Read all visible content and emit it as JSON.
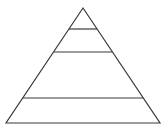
{
  "diagram": {
    "type": "pyramid",
    "levels": 4,
    "stroke_color": "#3a3a3a",
    "background": "#ffffff",
    "apex": [
      83,
      8
    ],
    "base": {
      "y": 123,
      "x1": 6,
      "x2": 160
    },
    "divider_ys": [
      29,
      52,
      98
    ],
    "labels": []
  }
}
